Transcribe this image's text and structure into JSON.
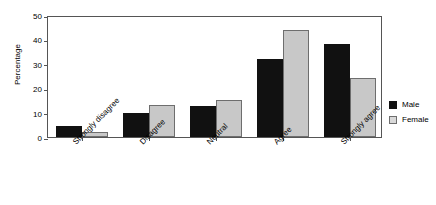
{
  "caption": "(g) Social media, n = 94 (35 male, 59 female)",
  "chart_data": {
    "type": "bar",
    "title": "",
    "xlabel": "",
    "ylabel": "Percentage",
    "ylim": [
      0,
      50
    ],
    "yticks": [
      0,
      10,
      20,
      30,
      40,
      50
    ],
    "grid": false,
    "legend_position": "right-outside",
    "categories": [
      "Strongly disagree",
      "Disagree",
      "Neutral",
      "Agree",
      "Strongly agree"
    ],
    "series": [
      {
        "name": "Male",
        "color": "#111111",
        "values": [
          4.5,
          10,
          12.7,
          32,
          38
        ]
      },
      {
        "name": "Female",
        "color": "#c8c8c8",
        "values": [
          2,
          13,
          15,
          44,
          24
        ]
      }
    ]
  },
  "legend": {
    "items": [
      {
        "label": "Male",
        "color": "#111111"
      },
      {
        "label": "Female",
        "color": "#d9d9d9"
      }
    ]
  }
}
